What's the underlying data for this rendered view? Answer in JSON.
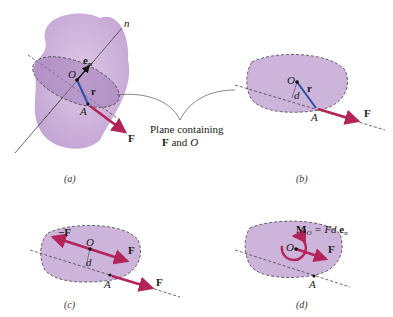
{
  "panels": {
    "a": {
      "caption": "(a)",
      "labels": {
        "axis": "n",
        "unit_vector": "e",
        "unit_sub": "n",
        "origin": "O",
        "position": "r",
        "point": "A",
        "force": "F"
      }
    },
    "b": {
      "caption": "(b)",
      "labels": {
        "origin": "O",
        "position": "r",
        "distance": "d",
        "point": "A",
        "force": "F"
      }
    },
    "c": {
      "caption": "(c)",
      "labels": {
        "neg_force": "−F",
        "origin": "O",
        "force_at_o": "F",
        "distance": "d",
        "point": "A",
        "force": "F"
      }
    },
    "d": {
      "caption": "(d)",
      "labels": {
        "moment": "M",
        "moment_sub": "O",
        "equation": " = Fd ",
        "unit": "e",
        "unit_sub": "n",
        "origin": "O",
        "force": "F",
        "point": "A"
      }
    }
  },
  "callout": {
    "line1": "Plane containing",
    "line2_bold": "F",
    "line2_rest": " and ",
    "line2_ital": "O"
  },
  "colors": {
    "body": "#c9a9d6",
    "plane": "#b48fc8",
    "force": "#b3245a",
    "position": "#2b4fa8",
    "dash": "#555555"
  }
}
